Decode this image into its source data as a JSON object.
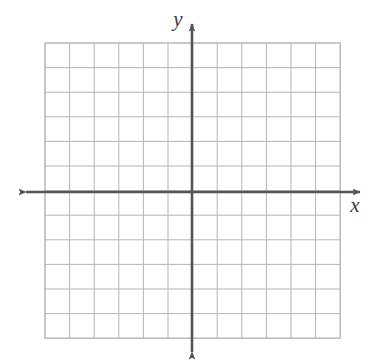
{
  "figure": {
    "type": "coordinate-plane",
    "title": "",
    "width": 369,
    "height": 364,
    "background_color": "#ffffff"
  },
  "grid": {
    "columns": 12,
    "rows": 12,
    "cell_size": 24.6,
    "left": 45,
    "top": 43,
    "right": 340,
    "bottom": 338,
    "line_color": "#b5b5b5",
    "line_width": 1,
    "border_color": "#b5b5b5",
    "visible": true
  },
  "axes": {
    "color": "#555555",
    "line_width": 2.6,
    "origin_x": 192,
    "origin_y": 192,
    "x_axis": {
      "label": "x",
      "label_x": 355,
      "label_y": 212,
      "start_x": 26,
      "end_x": 360,
      "arrow_start": true,
      "arrow_end": true
    },
    "y_axis": {
      "label": "y",
      "label_x": 178,
      "label_y": 26,
      "start_y": 352,
      "end_y": 24,
      "arrow_start": true,
      "arrow_end": true
    }
  },
  "chart_data": {
    "type": "scatter",
    "title": "",
    "xlabel": "x",
    "ylabel": "y",
    "xlim": [
      -6,
      6
    ],
    "ylim": [
      -6,
      6
    ],
    "x": [],
    "y": [],
    "series": [],
    "grid": true,
    "legend": "none",
    "xticks": [
      -6,
      -5,
      -4,
      -3,
      -2,
      -1,
      0,
      1,
      2,
      3,
      4,
      5,
      6
    ],
    "yticks": [
      -6,
      -5,
      -4,
      -3,
      -2,
      -1,
      0,
      1,
      2,
      3,
      4,
      5,
      6
    ],
    "xticklabels": [],
    "yticklabels": [],
    "annotations": []
  }
}
